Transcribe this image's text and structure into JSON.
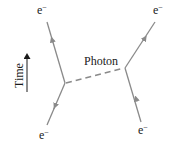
{
  "diagram": {
    "type": "feynman-diagram",
    "particle_label": "e",
    "particle_charge": "−",
    "photon_label": "Photon",
    "time_label": "Time",
    "colors": {
      "fermion_line": "#8a8a8a",
      "photon_line": "#8a8a8a",
      "text": "#1a1a1a"
    },
    "particles": [
      {
        "id": "top-left",
        "label": "e",
        "sup": "−"
      },
      {
        "id": "top-right",
        "label": "e",
        "sup": "−"
      },
      {
        "id": "bottom-left",
        "label": "e",
        "sup": "−"
      },
      {
        "id": "bottom-right",
        "label": "e",
        "sup": "−"
      }
    ]
  }
}
